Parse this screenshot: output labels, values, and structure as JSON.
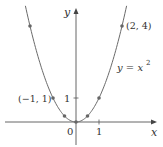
{
  "chart_data": {
    "type": "line",
    "title": "",
    "function_label": "y = x²",
    "xlabel": "x",
    "ylabel": "y",
    "x_ticks": [
      {
        "value": 0,
        "label": "0"
      },
      {
        "value": 1,
        "label": "1"
      }
    ],
    "y_ticks": [
      {
        "value": 1,
        "label": "1"
      }
    ],
    "series": [
      {
        "name": "y = x^2",
        "curve_domain": [
          -2.2,
          2.2
        ],
        "points": [
          {
            "x": -2,
            "y": 4
          },
          {
            "x": -1,
            "y": 1
          },
          {
            "x": -0.5,
            "y": 0.25
          },
          {
            "x": 0,
            "y": 0
          },
          {
            "x": 0.5,
            "y": 0.25
          },
          {
            "x": 1,
            "y": 1
          },
          {
            "x": 2,
            "y": 4
          }
        ]
      }
    ],
    "annotations": [
      {
        "text": "(2, 4)",
        "x": 2,
        "y": 4
      },
      {
        "text": "(−1, 1)",
        "x": -1,
        "y": 1
      }
    ],
    "grid": false,
    "legend": "none"
  },
  "labels": {
    "x_axis": "x",
    "y_axis": "y",
    "origin": "0",
    "x_tick_1": "1",
    "y_tick_1": "1",
    "point_2_4": "(2, 4)",
    "point_neg1_1": "(−1, 1)",
    "equation_lhs": "y = x",
    "equation_exp": "2"
  },
  "colors": {
    "curve": "#6a6a6a",
    "axis": "#555555",
    "point": "#666666",
    "text": "#333333"
  }
}
